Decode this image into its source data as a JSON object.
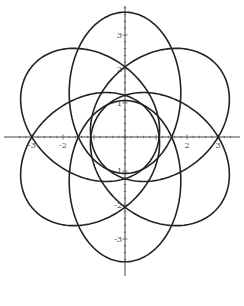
{
  "chart_data": {
    "type": "line",
    "title": "",
    "xlabel": "",
    "ylabel": "",
    "xlim": [
      -3.6,
      3.6
    ],
    "ylim": [
      -3.8,
      3.9
    ],
    "grid": false,
    "x_ticks": [
      -3,
      -2,
      -1,
      1,
      2,
      3
    ],
    "y_ticks": [
      -3,
      -2,
      -1,
      1,
      2,
      3
    ],
    "x_tick_labels": [
      "-3",
      "-2",
      "",
      "",
      "2",
      "3"
    ],
    "y_tick_labels": [
      "-3",
      "-2",
      "-1",
      "1",
      "2",
      "3"
    ],
    "curves": {
      "shape": "ellipse",
      "count": 6,
      "center_distance": 1.3,
      "semi_major": 2.37,
      "semi_minor": 1.8,
      "angles_deg": [
        90,
        150,
        210,
        270,
        330,
        30
      ]
    },
    "origin_px": [
      125,
      137
    ],
    "scale_px": [
      31,
      34
    ],
    "line_color": "#222222"
  }
}
